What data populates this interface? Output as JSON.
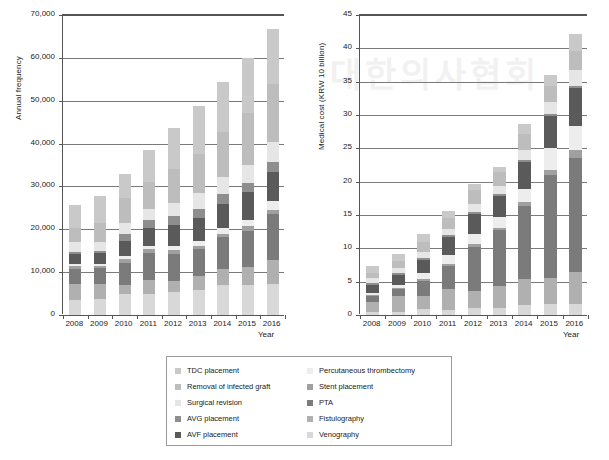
{
  "figure": {
    "background": "#ffffff",
    "watermark_text": "대한의사협회"
  },
  "series_colors": {
    "TDC placement": "#c9c9c9",
    "Removal of infected graft": "#bdbdbd",
    "Surgical revision": "#e6e6e6",
    "AVG placement": "#8e8e8e",
    "AVF placement": "#5a5a5a",
    "Percutaneous thrombectomy": "#ededed",
    "Stent placement": "#a0a0a0",
    "PTA": "#7b7b7b",
    "Fistulography": "#b0b0b0",
    "Venography": "#d8d8d8"
  },
  "legend": {
    "columns": [
      {
        "items": [
          {
            "label": "TDC placement",
            "color": "#c9c9c9"
          },
          {
            "label": "Removal of infected graft",
            "color": "#bdbdbd"
          },
          {
            "label": "Surgical revision",
            "color": "#e6e6e6"
          },
          {
            "label": "AVG placement",
            "color": "#8e8e8e"
          },
          {
            "label": "AVF placement",
            "color": "#5a5a5a"
          }
        ]
      },
      {
        "items": [
          {
            "label": "Percutaneous thrombectomy",
            "color": "#ededed"
          },
          {
            "label": "Stent placement",
            "color": "#a0a0a0"
          },
          {
            "label": "PTA",
            "color": "#7b7b7b"
          },
          {
            "label": "Fistulography",
            "color": "#b0b0b0"
          },
          {
            "label": "Venography",
            "color": "#d8d8d8"
          }
        ]
      }
    ]
  },
  "chart_data": [
    {
      "id": "annual-frequency",
      "type": "bar",
      "stacked": true,
      "title": "",
      "xlabel": "Year",
      "ylabel": "Annual frequency",
      "ylim": [
        0,
        70000
      ],
      "yticks": [
        0,
        10000,
        20000,
        30000,
        40000,
        50000,
        60000,
        70000
      ],
      "ytick_labels": [
        "0",
        "10,000",
        "20,000",
        "30,000",
        "40,000",
        "50,000",
        "60,000",
        "70,000"
      ],
      "grid": true,
      "legend_position": "below",
      "categories": [
        "2008",
        "2009",
        "2010",
        "2011",
        "2012",
        "2013",
        "2014",
        "2015",
        "2016"
      ],
      "series": [
        {
          "name": "Venography",
          "values": [
            3500,
            3800,
            4900,
            5000,
            5300,
            5900,
            6900,
            6900,
            7300
          ]
        },
        {
          "name": "Fistulography",
          "values": [
            3700,
            3500,
            2200,
            3200,
            2600,
            3100,
            3900,
            4300,
            5600
          ]
        },
        {
          "name": "PTA",
          "values": [
            3600,
            3600,
            5100,
            6200,
            6300,
            6300,
            7300,
            8500,
            10600
          ]
        },
        {
          "name": "Stent placement",
          "values": [
            700,
            600,
            900,
            900,
            900,
            900,
            900,
            1000,
            1100
          ]
        },
        {
          "name": "Percutaneous thrombectomy",
          "values": [
            400,
            400,
            700,
            900,
            1000,
            1100,
            1200,
            1500,
            1900
          ]
        },
        {
          "name": "AVF placement",
          "values": [
            2400,
            2600,
            3500,
            4200,
            4900,
            5400,
            5800,
            6400,
            6800
          ]
        },
        {
          "name": "AVG placement",
          "values": [
            500,
            500,
            1600,
            1700,
            2100,
            2100,
            2200,
            2200,
            2300
          ]
        },
        {
          "name": "Surgical revision",
          "values": [
            2200,
            2100,
            2600,
            2600,
            3000,
            3600,
            4100,
            4300,
            4800
          ]
        },
        {
          "name": "Removal of infected graft",
          "values": [
            3300,
            4400,
            5700,
            6400,
            7900,
            9100,
            10500,
            12000,
            13500
          ]
        },
        {
          "name": "TDC placement",
          "values": [
            5300,
            6200,
            5600,
            7300,
            9600,
            11200,
            11600,
            12900,
            12800
          ]
        }
      ]
    },
    {
      "id": "medical-cost",
      "type": "bar",
      "stacked": true,
      "title": "",
      "xlabel": "Year",
      "ylabel": "Medical cost (KRW 10 billion)",
      "ylim": [
        0,
        45
      ],
      "yticks": [
        0,
        5,
        10,
        15,
        20,
        25,
        30,
        35,
        40,
        45
      ],
      "ytick_labels": [
        "0",
        "5",
        "10",
        "15",
        "20",
        "25",
        "30",
        "35",
        "40",
        "45"
      ],
      "grid": true,
      "legend_position": "below",
      "categories": [
        "2008",
        "2009",
        "2010",
        "2011",
        "2012",
        "2013",
        "2014",
        "2015",
        "2016"
      ],
      "series": [
        {
          "name": "Venography",
          "values": [
            0.5,
            0.5,
            0.9,
            0.8,
            1.1,
            1.1,
            1.5,
            1.6,
            1.6
          ]
        },
        {
          "name": "Fistulography",
          "values": [
            1.5,
            2.4,
            1.9,
            3.1,
            2.5,
            3.3,
            3.9,
            4.0,
            4.8
          ]
        },
        {
          "name": "PTA",
          "values": [
            0.8,
            1.0,
            2.3,
            3.4,
            6.6,
            8.3,
            10.9,
            15.4,
            17.1
          ]
        },
        {
          "name": "Stent placement",
          "values": [
            0.2,
            0.2,
            0.3,
            0.4,
            0.5,
            0.4,
            0.6,
            0.7,
            1.2
          ]
        },
        {
          "name": "Percutaneous thrombectomy",
          "values": [
            0.3,
            0.4,
            0.9,
            1.3,
            1.5,
            1.6,
            2.0,
            3.4,
            3.7
          ]
        },
        {
          "name": "AVF placement",
          "values": [
            1.2,
            1.5,
            2.0,
            2.7,
            3.0,
            3.2,
            4.1,
            4.8,
            5.6
          ]
        },
        {
          "name": "AVG placement",
          "values": [
            0.3,
            0.3,
            0.3,
            0.3,
            0.3,
            0.3,
            0.3,
            0.3,
            0.3
          ]
        },
        {
          "name": "Surgical revision",
          "values": [
            0.7,
            0.7,
            0.8,
            0.9,
            1.1,
            1.2,
            1.5,
            1.7,
            2.5
          ]
        },
        {
          "name": "Removal of infected graft",
          "values": [
            0.8,
            1.1,
            1.5,
            1.7,
            2.2,
            2.0,
            2.3,
            2.5,
            2.8
          ]
        },
        {
          "name": "TDC placement",
          "values": [
            1.0,
            1.1,
            1.2,
            1.0,
            0.8,
            0.8,
            1.6,
            1.6,
            2.5
          ]
        }
      ]
    }
  ]
}
